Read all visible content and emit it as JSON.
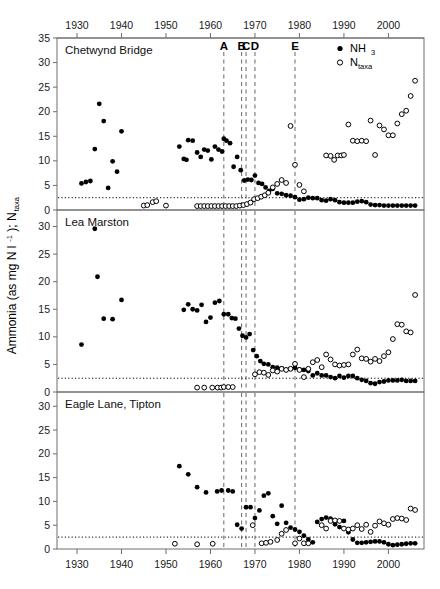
{
  "figure": {
    "y_axis_title": "Ammonia (as mg N l",
    "y_axis_title_sup": "-1",
    "y_axis_title_tail": "); N",
    "y_axis_title_sub": "taxa",
    "top_axis_ticks": [
      "1930",
      "1940",
      "1950",
      "1960",
      "1970",
      "1980",
      "1990",
      "2000"
    ],
    "bottom_axis_ticks": [
      "1930",
      "1940",
      "1950",
      "1960",
      "1970",
      "1980",
      "1990",
      "2000"
    ],
    "event_markers": [
      {
        "label": "A",
        "year": 1963
      },
      {
        "label": "B",
        "year": 1967
      },
      {
        "label": "C",
        "year": 1968
      },
      {
        "label": "D",
        "year": 1970
      },
      {
        "label": "E",
        "year": 1979
      }
    ],
    "legend": [
      {
        "label": "NH",
        "sub": "3",
        "marker": "filled-circle",
        "name": "ammonia"
      },
      {
        "label": "N",
        "sub": "taxa",
        "marker": "open-circle",
        "name": "taxa-count"
      }
    ],
    "threshold_value": 2.5,
    "colors": {
      "ink": "#000000",
      "frame": "#6e6e6e",
      "event_line": "#666666"
    }
  },
  "chart_data": [
    {
      "type": "scatter",
      "title": "Chetwynd Bridge",
      "panel": 1,
      "xlabel": "",
      "ylabel": "Ammonia (as mg N l-1); Ntaxa",
      "xlim": [
        1925,
        2008
      ],
      "ylim": [
        0,
        35
      ],
      "yticks": [
        0,
        5,
        10,
        15,
        20,
        25,
        30,
        35
      ],
      "grid": false,
      "legend_position": "top-right",
      "threshold_line": 2.5,
      "series": [
        {
          "name": "NH3",
          "marker": "filled-circle",
          "x": [
            1931,
            1932,
            1933,
            1934,
            1935,
            1936,
            1937,
            1938,
            1939,
            1940,
            1953,
            1954,
            1954.6,
            1955,
            1956,
            1957,
            1957.8,
            1958.6,
            1959.4,
            1960.2,
            1961,
            1961.8,
            1962.6,
            1963,
            1963.6,
            1964.4,
            1965.2,
            1966,
            1966.8,
            1967.6,
            1968.4,
            1969.2,
            1970,
            1970.8,
            1971.6,
            1972.4,
            1973.2,
            1974,
            1975,
            1976,
            1977,
            1978,
            1979,
            1980,
            1981,
            1982,
            1983,
            1984,
            1985,
            1986,
            1987,
            1988,
            1989,
            1990,
            1991,
            1992,
            1993,
            1994,
            1995,
            1996,
            1997,
            1998,
            1999,
            2000,
            2001,
            2002,
            2003,
            2004,
            2005,
            2006
          ],
          "y": [
            5.4,
            5.7,
            5.9,
            12.4,
            21.6,
            18.1,
            4.5,
            9.9,
            7.8,
            16.0,
            12.9,
            10.4,
            10.2,
            14.2,
            14.1,
            11.7,
            10.8,
            12.3,
            12.1,
            10.3,
            12.9,
            12.3,
            11.9,
            14.5,
            14.1,
            13.6,
            8.8,
            10.8,
            8.1,
            6.0,
            6.2,
            6.1,
            7.0,
            5.5,
            5.3,
            4.6,
            3.9,
            4.3,
            3.4,
            3.3,
            3.0,
            2.9,
            2.6,
            2.1,
            2.2,
            2.5,
            2.4,
            2.4,
            2.0,
            1.9,
            2.2,
            2.0,
            1.6,
            1.5,
            1.5,
            1.5,
            1.7,
            1.8,
            1.6,
            1.1,
            1.0,
            1.0,
            0.9,
            0.9,
            0.9,
            0.9,
            0.9,
            0.9,
            0.9,
            0.9
          ]
        },
        {
          "name": "Ntaxa",
          "marker": "open-circle",
          "x": [
            1945,
            1945.8,
            1947,
            1947.8,
            1950,
            1957,
            1957.8,
            1958.6,
            1959.4,
            1960.2,
            1961,
            1961.8,
            1962.6,
            1963.4,
            1964.2,
            1965,
            1965.8,
            1966.6,
            1967.4,
            1968.2,
            1969,
            1969.8,
            1970.6,
            1971.4,
            1972.2,
            1973,
            1974,
            1975,
            1976,
            1977,
            1978,
            1979,
            1980,
            1981,
            1986,
            1987,
            1987.8,
            1988.6,
            1989.4,
            1990,
            1991,
            1992,
            1993,
            1994,
            1995,
            1996,
            1997,
            1998,
            1999,
            2000,
            2001,
            2002,
            2003,
            2004,
            2005,
            2006
          ],
          "y": [
            0.9,
            1.0,
            1.6,
            1.8,
            0.9,
            0.8,
            0.8,
            0.8,
            0.8,
            0.8,
            0.8,
            0.8,
            0.8,
            0.8,
            0.8,
            0.8,
            0.8,
            0.9,
            1.0,
            1.2,
            1.5,
            2.2,
            2.4,
            2.7,
            3.0,
            3.5,
            4.6,
            5.3,
            6.1,
            5.5,
            17.1,
            9.2,
            5.1,
            3.8,
            11.1,
            11.0,
            10.2,
            11.1,
            11.1,
            11.2,
            17.4,
            14.1,
            14.0,
            14.1,
            14.0,
            18.2,
            11.2,
            17.2,
            16.4,
            15.2,
            15.2,
            17.6,
            19.5,
            20.2,
            23.2,
            26.3
          ]
        }
      ]
    },
    {
      "type": "scatter",
      "title": "Lea Marston",
      "panel": 2,
      "xlabel": "",
      "ylabel": "Ammonia (as mg N l-1); Ntaxa",
      "xlim": [
        1925,
        2008
      ],
      "ylim": [
        0,
        33
      ],
      "yticks": [
        0,
        5,
        10,
        15,
        20,
        25,
        30
      ],
      "grid": false,
      "legend_position": "none",
      "threshold_line": 2.5,
      "series": [
        {
          "name": "NH3",
          "marker": "filled-circle",
          "x": [
            1931,
            1934,
            1934.6,
            1936,
            1938,
            1940,
            1954,
            1955,
            1956,
            1957,
            1958,
            1959,
            1960,
            1961,
            1962,
            1963,
            1964,
            1964.8,
            1965.6,
            1966.4,
            1967.2,
            1968,
            1968.8,
            1969.6,
            1970.4,
            1971.2,
            1972,
            1973,
            1974,
            1975,
            1976,
            1977,
            1978,
            1979,
            1980,
            1981,
            1982,
            1983,
            1984,
            1985,
            1986,
            1987,
            1988,
            1989,
            1990,
            1991,
            1992,
            1993,
            1994,
            1995,
            1996,
            1997,
            1998,
            1999,
            2000,
            2001,
            2002,
            2003,
            2004,
            2005,
            2006
          ],
          "y": [
            8.6,
            29.6,
            20.9,
            13.3,
            13.2,
            16.7,
            14.9,
            15.9,
            15.0,
            14.8,
            15.8,
            12.7,
            13.5,
            16.2,
            16.5,
            14.1,
            14.1,
            13.4,
            13.3,
            11.5,
            10.2,
            9.9,
            10.5,
            7.6,
            6.5,
            5.6,
            5.1,
            5.0,
            4.5,
            4.4,
            4.3,
            4.0,
            4.2,
            4.4,
            4.1,
            4.0,
            3.8,
            3.0,
            3.4,
            3.0,
            3.0,
            2.7,
            2.5,
            2.9,
            2.6,
            2.9,
            2.9,
            2.5,
            2.2,
            2.0,
            1.6,
            1.5,
            1.8,
            1.9,
            2.1,
            2.1,
            2.1,
            2.2,
            2.0,
            2.0,
            2.0
          ]
        },
        {
          "name": "Ntaxa",
          "marker": "open-circle",
          "x": [
            1957,
            1958.6,
            1960.4,
            1961.6,
            1962.4,
            1963,
            1964,
            1965,
            1970,
            1971,
            1972,
            1973,
            1974,
            1975,
            1976,
            1977,
            1978,
            1979,
            1980,
            1981,
            1982,
            1983,
            1984,
            1985,
            1986,
            1987,
            1988,
            1989,
            1990,
            1991,
            1992,
            1993,
            1994,
            1995,
            1996,
            1997,
            1998,
            1999,
            2000,
            2001,
            2002,
            2003,
            2004,
            2005,
            2006
          ],
          "y": [
            0.8,
            0.8,
            0.8,
            0.8,
            0.8,
            0.9,
            0.9,
            0.9,
            3.2,
            3.6,
            3.5,
            3.1,
            3.9,
            3.7,
            4.2,
            4.0,
            4.2,
            5.1,
            4.0,
            2.7,
            4.2,
            5.4,
            5.8,
            4.5,
            6.8,
            5.9,
            5.0,
            4.8,
            4.9,
            5.0,
            6.8,
            7.7,
            6.1,
            6.0,
            5.5,
            6.0,
            5.6,
            6.5,
            7.2,
            9.6,
            12.3,
            12.2,
            11.0,
            10.8,
            17.6
          ]
        }
      ]
    },
    {
      "type": "scatter",
      "title": "Eagle Lane, Tipton",
      "panel": 3,
      "xlabel": "",
      "ylabel": "Ammonia (as mg N l-1); Ntaxa",
      "xlim": [
        1925,
        2008
      ],
      "ylim": [
        0,
        33
      ],
      "yticks": [
        0,
        5,
        10,
        15,
        20,
        25,
        30
      ],
      "grid": false,
      "legend_position": "none",
      "threshold_line": 2.5,
      "series": [
        {
          "name": "NH3",
          "marker": "filled-circle",
          "x": [
            1953,
            1955,
            1957,
            1959,
            1961.5,
            1962.5,
            1964,
            1965,
            1966,
            1967,
            1968,
            1969,
            1970,
            1971,
            1972,
            1973,
            1974,
            1975,
            1976,
            1977,
            1978,
            1979,
            1980,
            1981,
            1982,
            1983,
            1984,
            1985,
            1986,
            1987,
            1988,
            1989,
            1990,
            1991,
            1992,
            1993,
            1994,
            1995,
            1996,
            1997,
            1998,
            1999,
            2000,
            2001,
            2002,
            2003,
            2004,
            2005,
            2006
          ],
          "y": [
            17.4,
            15.7,
            13.0,
            11.9,
            12.1,
            12.3,
            12.3,
            12.1,
            5.1,
            4.3,
            8.8,
            8.8,
            6.5,
            8.1,
            11.2,
            11.7,
            6.9,
            5.3,
            9.1,
            5.5,
            4.5,
            4.1,
            3.6,
            2.8,
            2.0,
            1.4,
            5.7,
            6.3,
            6.6,
            6.4,
            5.2,
            4.6,
            5.9,
            3.5,
            2.0,
            1.3,
            1.3,
            1.4,
            1.5,
            1.6,
            1.6,
            1.4,
            1.0,
            0.8,
            0.9,
            1.0,
            1.1,
            1.2,
            1.2
          ]
        },
        {
          "name": "Ntaxa",
          "marker": "open-circle",
          "x": [
            1952,
            1957,
            1960.5,
            1969.5,
            1971.5,
            1972.5,
            1973.5,
            1975,
            1976,
            1977,
            1979,
            1980,
            1981,
            1982,
            1985,
            1986,
            1987,
            1988,
            1989,
            1990,
            1991,
            1992,
            1993,
            1994,
            1995,
            1996,
            1997,
            1998,
            1999,
            2000,
            2001,
            2002,
            2003,
            2004,
            2005,
            2006
          ],
          "y": [
            1.1,
            1.0,
            1.1,
            5.0,
            1.2,
            1.3,
            1.5,
            1.9,
            3.2,
            4.0,
            1.2,
            2.2,
            1.2,
            1.2,
            5.0,
            4.3,
            5.9,
            6.0,
            5.9,
            4.3,
            4.1,
            4.3,
            5.0,
            4.2,
            5.1,
            3.6,
            4.9,
            5.8,
            5.4,
            5.1,
            6.3,
            6.5,
            6.4,
            6.1,
            8.5,
            8.2
          ]
        }
      ]
    }
  ]
}
